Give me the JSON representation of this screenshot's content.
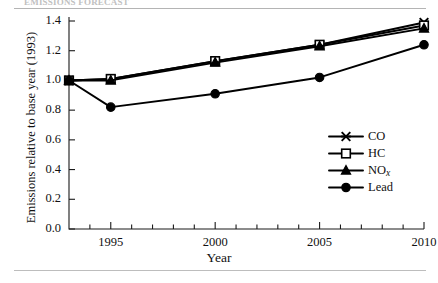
{
  "figure": {
    "cropped_heading": "EMISSIONS FORECAST",
    "has_top_rule": true,
    "has_bottom_rule": true
  },
  "chart_data": {
    "type": "line",
    "title": "",
    "subtitle": "",
    "xlabel": "Year",
    "ylabel": "Emissions relative to base year (1993)",
    "xlim": [
      1993,
      2010
    ],
    "ylim": [
      0.0,
      1.4
    ],
    "grid": false,
    "legend_position": "center-right",
    "x": [
      1993,
      1995,
      2000,
      2005,
      2010
    ],
    "xticks_major": [
      1995,
      2000,
      2005,
      2010
    ],
    "xtick_labels": [
      "1995",
      "2000",
      "2005",
      "2010"
    ],
    "xticks_minor": [
      1994,
      1996,
      1997,
      1998,
      1999,
      2001,
      2002,
      2003,
      2004,
      2006,
      2007,
      2008,
      2009
    ],
    "yticks": [
      0.0,
      0.2,
      0.4,
      0.6,
      0.8,
      1.0,
      1.2,
      1.4
    ],
    "ytick_labels": [
      "0.0",
      "0.2",
      "0.4",
      "0.6",
      "0.8",
      "1.0",
      "1.2",
      "1.4"
    ],
    "series": [
      {
        "name": "CO",
        "marker": "cross",
        "values": [
          1.0,
          1.01,
          1.13,
          1.24,
          1.39
        ]
      },
      {
        "name": "HC",
        "marker": "square",
        "values": [
          1.0,
          1.01,
          1.13,
          1.24,
          1.37
        ]
      },
      {
        "name": "NOx",
        "marker": "triangle",
        "values": [
          1.0,
          1.0,
          1.12,
          1.23,
          1.35
        ]
      },
      {
        "name": "Lead",
        "marker": "circle",
        "values": [
          1.0,
          0.82,
          0.91,
          1.02,
          1.24
        ]
      }
    ],
    "legend": [
      {
        "label": "CO",
        "marker": "cross"
      },
      {
        "label": "HC",
        "marker": "square"
      },
      {
        "label": "NOx",
        "marker": "triangle",
        "label_base": "NO",
        "label_sub": "x"
      },
      {
        "label": "Lead",
        "marker": "circle"
      }
    ],
    "colors": {
      "line": "#000000",
      "marker_fill": "#000000",
      "marker_open_fill": "#ffffff",
      "axis": "#1a1a1a"
    }
  }
}
